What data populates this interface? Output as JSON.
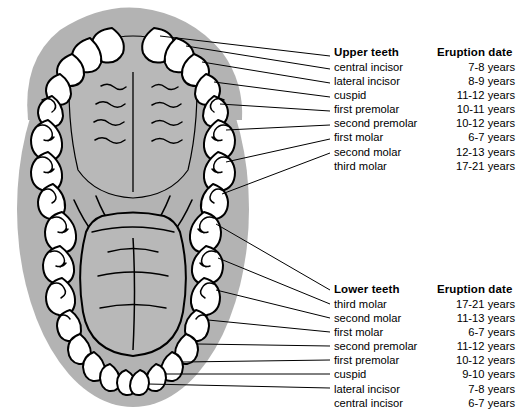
{
  "figure": {
    "type": "dental-anatomy-diagram",
    "background_color": "#ffffff",
    "silhouette_color": "#b3b3b3",
    "tooth_fill": "#ffffff",
    "line_color": "#000000"
  },
  "upper": {
    "header_teeth": "Upper teeth",
    "header_date": "Eruption date",
    "rows": [
      {
        "tooth": "central incisor",
        "date": "7-8 years"
      },
      {
        "tooth": "lateral incisor",
        "date": "8-9 years"
      },
      {
        "tooth": "cuspid",
        "date": "11-12 years"
      },
      {
        "tooth": "first premolar",
        "date": "10-11 years"
      },
      {
        "tooth": "second premolar",
        "date": "10-12 years"
      },
      {
        "tooth": "first molar",
        "date": "6-7 years"
      },
      {
        "tooth": "second molar",
        "date": "12-13 years"
      },
      {
        "tooth": "third molar",
        "date": "17-21 years"
      }
    ]
  },
  "lower": {
    "header_teeth": "Lower teeth",
    "header_date": "Eruption date",
    "rows": [
      {
        "tooth": "third molar",
        "date": "17-21 years"
      },
      {
        "tooth": "second molar",
        "date": "11-13 years"
      },
      {
        "tooth": "first molar",
        "date": "6-7 years"
      },
      {
        "tooth": "second premolar",
        "date": "11-12 years"
      },
      {
        "tooth": "first premolar",
        "date": "10-12 years"
      },
      {
        "tooth": "cuspid",
        "date": "9-10 years"
      },
      {
        "tooth": "lateral incisor",
        "date": "7-8 years"
      },
      {
        "tooth": "central incisor",
        "date": "6-7 years"
      }
    ]
  }
}
